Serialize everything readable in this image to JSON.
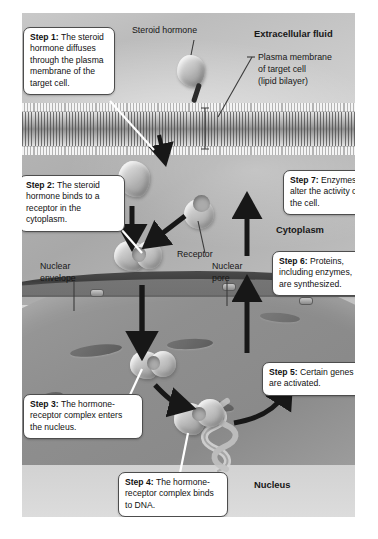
{
  "diagram": {
    "regions": {
      "extracellular": "Extracellular fluid",
      "cytoplasm": "Cytoplasm",
      "nucleus": "Nucleus"
    },
    "labels": {
      "steroid_hormone": "Steroid hormone",
      "plasma_membrane_line1": "Plasma membrane",
      "plasma_membrane_line2": "of target cell",
      "plasma_membrane_line3": "(lipid bilayer)",
      "receptor": "Receptor",
      "nuclear_envelope_line1": "Nuclear",
      "nuclear_envelope_line2": "envelope",
      "nuclear_pore_line1": "Nuclear",
      "nuclear_pore_line2": "pore"
    },
    "steps": [
      {
        "id": "step1",
        "number": "Step 1:",
        "text": " The steroid hormone diffuses through the plasma membrane of the target cell.",
        "full": "Step 1: The steroid hormone diffuses through the plasma membrane of the target cell."
      },
      {
        "id": "step2",
        "number": "Step 2:",
        "text": " The steroid hormone binds to a receptor in the cytoplasm.",
        "full": "Step 2: The steroid hormone binds to a receptor in the cytoplasm."
      },
      {
        "id": "step3",
        "number": "Step 3:",
        "text": " The hormone-receptor complex enters the nucleus.",
        "full": "Step 3: The hormone-receptor complex enters the nucleus."
      },
      {
        "id": "step4",
        "number": "Step 4:",
        "text": " The hormone-receptor complex binds to DNA.",
        "full": "Step 4: The hormone-receptor complex binds to DNA."
      },
      {
        "id": "step5",
        "number": "Step 5:",
        "text": " Certain genes are activated.",
        "full": "Step 5: Certain genes are activated."
      },
      {
        "id": "step6",
        "number": "Step 6:",
        "text": " Proteins, including enzymes, are synthesized.",
        "full": "Step 6: Proteins, including enzymes, are synthesized."
      },
      {
        "id": "step7",
        "number": "Step 7:",
        "text": " Enzymes alter the activity of the cell.",
        "full": "Step 7: Enzymes alter the activity of the cell."
      }
    ],
    "colors": {
      "callout_bg": "#ffffff",
      "callout_border": "#4d4d4d",
      "arrow": "#171717",
      "extracellular_fluid": "#c4c4c4",
      "cytoplasm_fill": "#b0b0b0",
      "nucleus_fill": "#929292",
      "nuclear_envelope": "#414141",
      "text": "#111111"
    }
  }
}
